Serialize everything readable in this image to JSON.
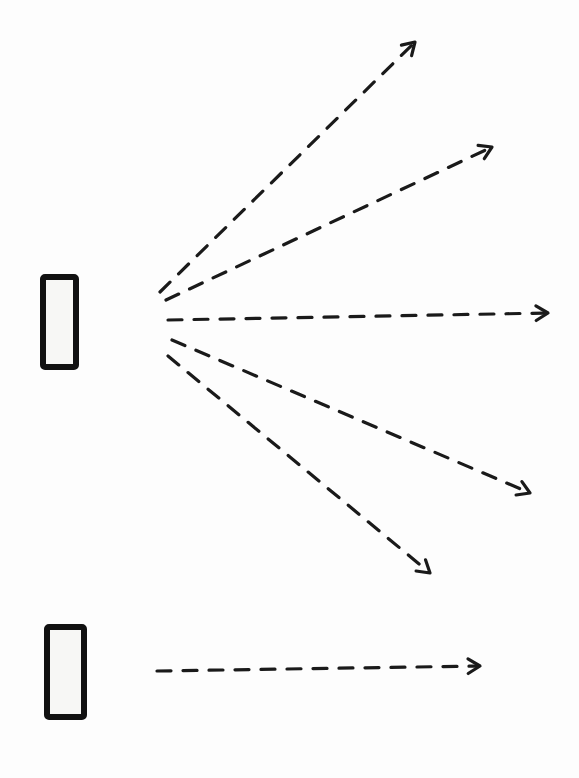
{
  "diagram": {
    "type": "hand-drawn sketch",
    "background": "#fdfdfd",
    "stroke_color": "#1a1a1a",
    "emitters": [
      {
        "id": "top-emitter",
        "shape": "rectangle",
        "x": 43,
        "y": 277,
        "width": 33,
        "height": 90,
        "arrows": [
          {
            "from": [
              160,
              292
            ],
            "to": [
              415,
              42
            ],
            "style": "dashed"
          },
          {
            "from": [
              166,
              300
            ],
            "to": [
              492,
              147
            ],
            "style": "dashed"
          },
          {
            "from": [
              168,
              320
            ],
            "to": [
              548,
              313
            ],
            "style": "dashed"
          },
          {
            "from": [
              172,
              340
            ],
            "to": [
              530,
              493
            ],
            "style": "dashed"
          },
          {
            "from": [
              168,
              356
            ],
            "to": [
              430,
              573
            ],
            "style": "dashed"
          }
        ]
      },
      {
        "id": "bottom-emitter",
        "shape": "rectangle",
        "x": 47,
        "y": 627,
        "width": 37,
        "height": 90,
        "arrows": [
          {
            "from": [
              157,
              671
            ],
            "to": [
              480,
              666
            ],
            "style": "dashed"
          }
        ]
      }
    ]
  }
}
